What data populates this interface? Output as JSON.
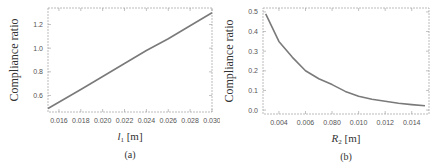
{
  "chart_data": [
    {
      "type": "line",
      "panel_label": "(a)",
      "title": "",
      "xlabel": "l1 [m]",
      "xlabel_main": "l",
      "xlabel_sub": "1",
      "xlabel_unit": "[m]",
      "ylabel": "Compliance ratio",
      "xlim": [
        0.015,
        0.03
      ],
      "ylim": [
        0.46,
        1.34
      ],
      "xticks": [
        "0.016",
        "0.018",
        "0.020",
        "0.022",
        "0.024",
        "0.026",
        "0.028",
        "0.030"
      ],
      "xtick_values": [
        0.016,
        0.018,
        0.02,
        0.022,
        0.024,
        0.026,
        0.028,
        0.03
      ],
      "yticks": [
        "0.6",
        "0.8",
        "1.0",
        "1.2"
      ],
      "ytick_values": [
        0.6,
        0.8,
        1.0,
        1.2
      ],
      "grid": false,
      "series": [
        {
          "name": "Compliance ratio",
          "x": [
            0.015,
            0.018,
            0.02,
            0.022,
            0.024,
            0.026,
            0.028,
            0.03
          ],
          "y": [
            0.49,
            0.65,
            0.76,
            0.87,
            0.98,
            1.08,
            1.19,
            1.3
          ]
        }
      ]
    },
    {
      "type": "line",
      "panel_label": "(b)",
      "title": "",
      "xlabel": "R2 [m]",
      "xlabel_main": "R",
      "xlabel_sub": "2",
      "xlabel_unit": "[m]",
      "ylabel": "Compliance ratio",
      "xlim": [
        0.0028,
        0.0153
      ],
      "ylim": [
        -0.02,
        0.52
      ],
      "xticks": [
        "0.004",
        "0.006",
        "0.080",
        "0.010",
        "0.012",
        "0.014"
      ],
      "xtick_values": [
        0.004,
        0.006,
        0.008,
        0.01,
        0.012,
        0.014
      ],
      "yticks": [
        "0.0",
        "0.1",
        "0.2",
        "0.3",
        "0.4",
        "0.5"
      ],
      "ytick_values": [
        0.0,
        0.1,
        0.2,
        0.3,
        0.4,
        0.5
      ],
      "grid": false,
      "series": [
        {
          "name": "Compliance ratio",
          "x": [
            0.003,
            0.004,
            0.005,
            0.006,
            0.007,
            0.008,
            0.009,
            0.01,
            0.011,
            0.012,
            0.013,
            0.014,
            0.015
          ],
          "y": [
            0.49,
            0.35,
            0.27,
            0.2,
            0.16,
            0.13,
            0.095,
            0.07,
            0.055,
            0.045,
            0.035,
            0.028,
            0.022
          ]
        }
      ]
    }
  ]
}
